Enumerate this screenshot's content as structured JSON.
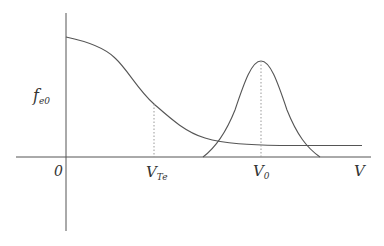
{
  "diagram": {
    "type": "distribution-function-sketch",
    "colors": {
      "line": "#555555",
      "dotted": "#999999",
      "text": "#333333",
      "background": "#ffffff"
    },
    "axes": {
      "y_label": {
        "main": "f",
        "sub": "e0"
      },
      "x_label": "V",
      "origin_label": "0"
    },
    "markers": [
      {
        "name": "V_Te",
        "main": "V",
        "sub": "Te",
        "description": "thermal velocity marker on decaying curve"
      },
      {
        "name": "V_0",
        "main": "V",
        "sub": "0",
        "description": "beam velocity at Gaussian peak"
      }
    ],
    "curves": [
      {
        "name": "background-distribution",
        "description": "monotonically decaying curve starting on y-axis, flattening to a constant tail"
      },
      {
        "name": "beam-distribution",
        "description": "Gaussian bump centered at V_0"
      }
    ]
  }
}
